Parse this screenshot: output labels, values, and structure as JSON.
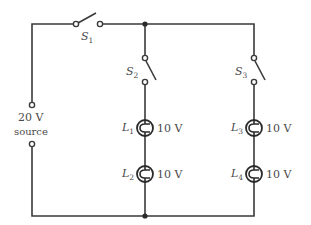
{
  "diagram": {
    "type": "circuit",
    "source": {
      "voltage_label": "20 V",
      "name_label": "source"
    },
    "switches": [
      {
        "id": "S1",
        "letter": "S",
        "sub": "1"
      },
      {
        "id": "S2",
        "letter": "S",
        "sub": "2"
      },
      {
        "id": "S3",
        "letter": "S",
        "sub": "3"
      }
    ],
    "lamps": [
      {
        "id": "L1",
        "letter": "L",
        "sub": "1",
        "rating": "10 V"
      },
      {
        "id": "L2",
        "letter": "L",
        "sub": "2",
        "rating": "10 V"
      },
      {
        "id": "L3",
        "letter": "L",
        "sub": "3",
        "rating": "10 V"
      },
      {
        "id": "L4",
        "letter": "L",
        "sub": "4",
        "rating": "10 V"
      }
    ],
    "colors": {
      "wire": "#3a3a3a",
      "text": "#4a4a4a",
      "background": "#ffffff"
    }
  }
}
